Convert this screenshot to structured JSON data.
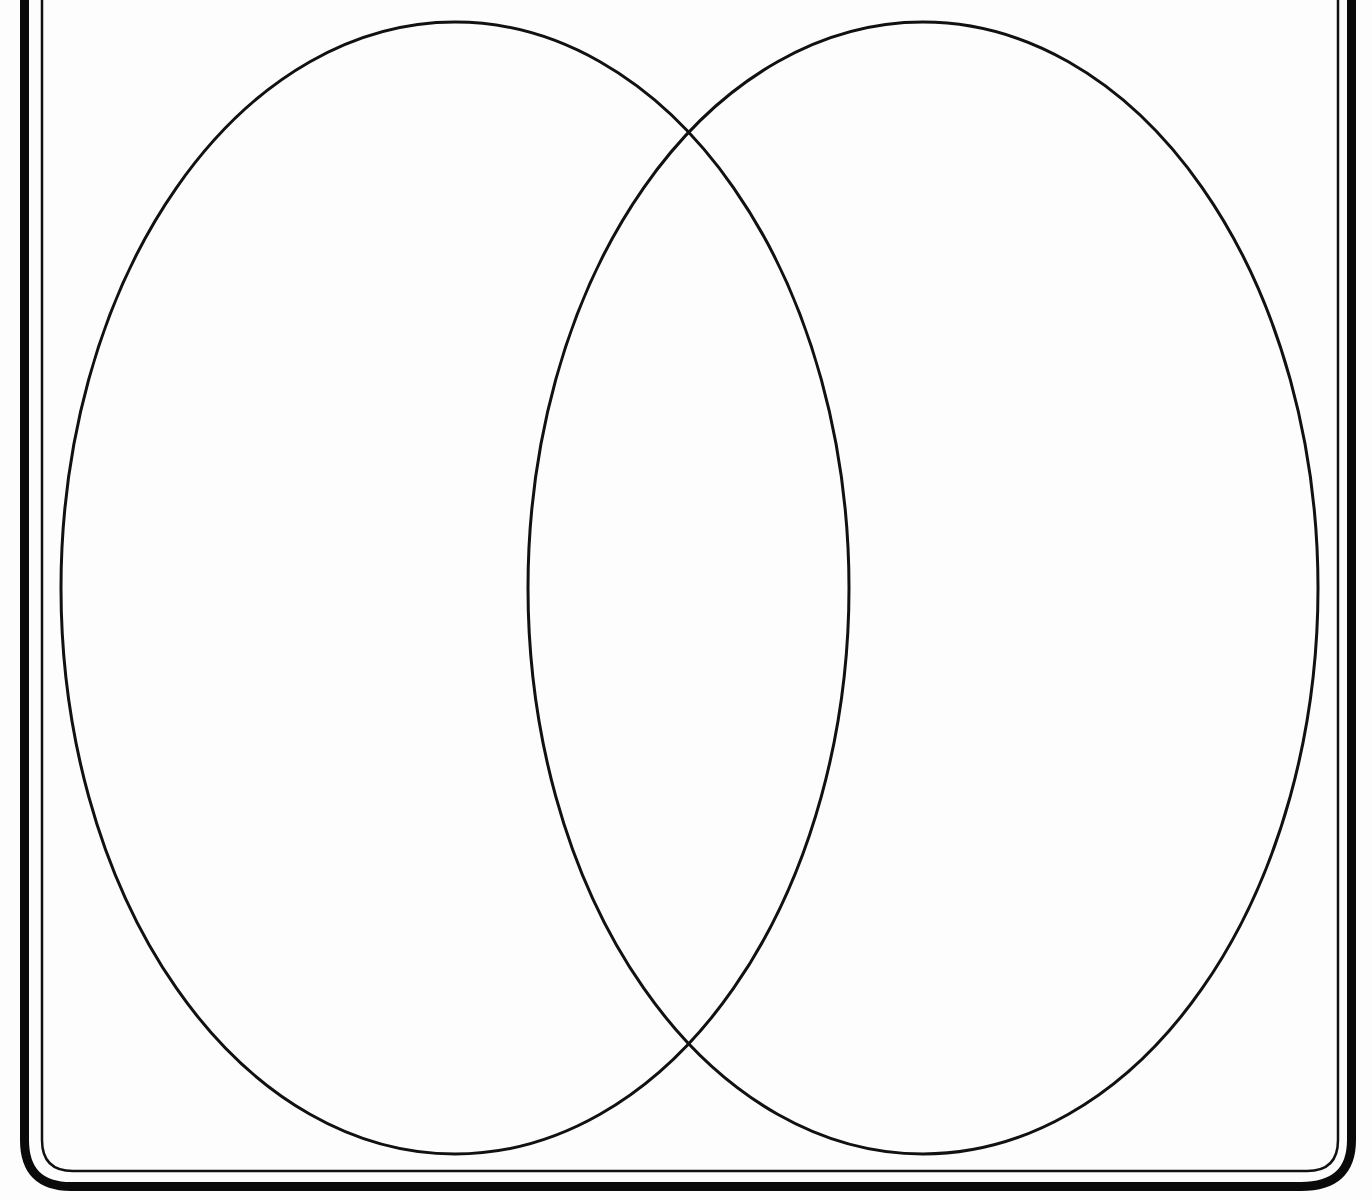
{
  "diagram": {
    "type": "venn",
    "set_count": 2,
    "sets": [
      {
        "id": "left",
        "label": "",
        "cx": 455,
        "cy": 588,
        "rx": 394,
        "ry": 566
      },
      {
        "id": "right",
        "label": "",
        "cx": 923,
        "cy": 588,
        "rx": 395,
        "ry": 566
      }
    ],
    "intersection_label": "",
    "colors": {
      "stroke": "#111111",
      "background": "#fdfdfd",
      "frame": "#0a0a0a"
    }
  }
}
